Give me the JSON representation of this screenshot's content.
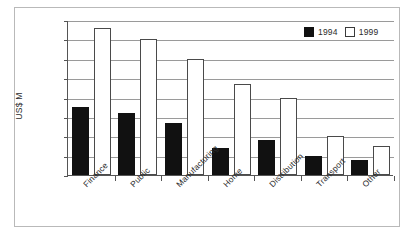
{
  "chart_data": {
    "type": "bar",
    "title": "",
    "xlabel": "",
    "ylabel": "US$ M",
    "ylim": [
      0,
      8000
    ],
    "ytick_step": 1000,
    "yticks": [
      0,
      1000,
      2000,
      3000,
      4000,
      5000,
      6000,
      7000,
      8000
    ],
    "ytick_labels": [
      "0",
      "1000",
      "2000",
      "3000",
      "4000",
      "5000",
      "6000",
      "7000",
      "8000"
    ],
    "grid": true,
    "legend_position": "top-right",
    "categories": [
      "Finance",
      "Public",
      "Manufacturing",
      "Home",
      "Distribution",
      "Transport",
      "Other"
    ],
    "series": [
      {
        "name": "1994",
        "color": "#111111",
        "values": [
          3500,
          3200,
          2700,
          1400,
          1800,
          1000,
          800
        ]
      },
      {
        "name": "1999",
        "color": "#ffffff",
        "values": [
          7600,
          7000,
          6000,
          4700,
          4000,
          2000,
          1500
        ]
      }
    ]
  },
  "legend": {
    "entries": [
      {
        "label": "1994"
      },
      {
        "label": "1999"
      }
    ]
  },
  "colors": {
    "series_1994": "#111111",
    "series_1999": "#ffffff",
    "axis": "#555555",
    "grid": "#9a9a9a",
    "frame": "#b9b9b9",
    "text": "#2b2b2b"
  }
}
